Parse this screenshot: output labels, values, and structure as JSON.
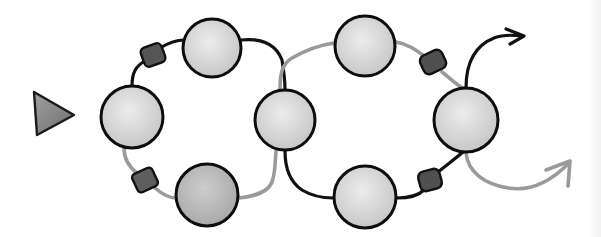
{
  "diagram": {
    "colors": {
      "background": "#ffffff",
      "node_fill_light": "#e4e4e4",
      "node_fill_dark": "#b9b9b9",
      "node_outline": "#0d0d0d",
      "gate_fill": "#555555",
      "dark_path": "#111111",
      "light_path": "#9a9a9a",
      "triangle_fill": "#8a8a8a"
    },
    "start_marker": {
      "shape": "triangle",
      "points": [
        [
          34,
          92
        ],
        [
          74,
          115
        ],
        [
          37,
          135
        ]
      ]
    },
    "nodes": [
      {
        "id": "left",
        "cx": 132,
        "cy": 117,
        "r": 32
      },
      {
        "id": "top-left",
        "cx": 212,
        "cy": 48,
        "r": 30
      },
      {
        "id": "bottom-left",
        "cx": 207,
        "cy": 195,
        "r": 32
      },
      {
        "id": "center",
        "cx": 285,
        "cy": 120,
        "r": 31
      },
      {
        "id": "top-right",
        "cx": 365,
        "cy": 46,
        "r": 31
      },
      {
        "id": "bottom-right",
        "cx": 365,
        "cy": 197,
        "r": 32
      },
      {
        "id": "right",
        "cx": 466,
        "cy": 120,
        "r": 33
      }
    ],
    "gates": [
      {
        "id": "gate-top-left",
        "x": 152,
        "y": 55
      },
      {
        "id": "gate-bottom-left",
        "x": 145,
        "y": 180
      },
      {
        "id": "gate-top-right",
        "x": 433,
        "y": 62
      },
      {
        "id": "gate-bottom-right",
        "x": 430,
        "y": 180
      }
    ],
    "exit_arrows": [
      {
        "id": "exit-up",
        "color": "dark",
        "tip": [
          524,
          36
        ]
      },
      {
        "id": "exit-down",
        "color": "light",
        "tip": [
          570,
          163
        ]
      }
    ]
  }
}
